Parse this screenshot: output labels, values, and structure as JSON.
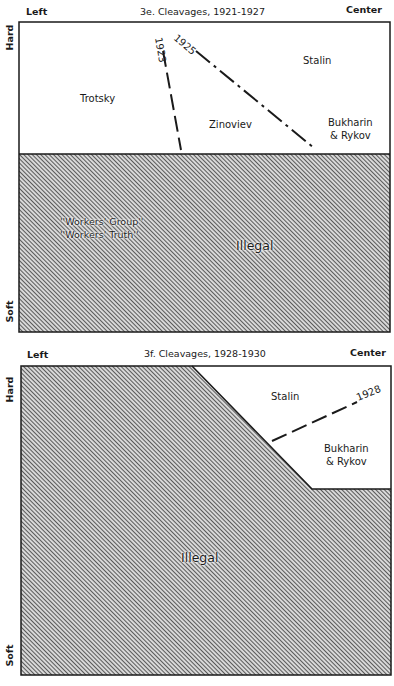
{
  "panel_e": {
    "title": "3e. Cleavages, 1921-1927",
    "axis_left": "Left",
    "axis_right": "Center",
    "axis_top": "Hard",
    "axis_bottom": "Soft",
    "regions": {
      "trotsky": "Trotsky",
      "zinoviev": "Zinoviev",
      "stalin": "Stalin",
      "bukharin_line1": "Bukharin",
      "bukharin_line2": "& Rykov",
      "illegal": "Illegal",
      "workers_group": "''Workers' Group''",
      "workers_truth": "''Workers' Truth''"
    },
    "lines": {
      "l1923": "1923",
      "l1925": "1925"
    }
  },
  "panel_f": {
    "title": "3f. Cleavages, 1928-1930",
    "axis_left": "Left",
    "axis_right": "Center",
    "axis_top": "Hard",
    "axis_bottom": "Soft",
    "regions": {
      "stalin": "Stalin",
      "bukharin_line1": "Bukharin",
      "bukharin_line2": "& Rykov",
      "illegal": "Illegal"
    },
    "lines": {
      "l1928": "1928"
    }
  },
  "colors": {
    "ink": "#1a1a1a",
    "hatch": "#3a3a3a",
    "background": "#ffffff"
  }
}
